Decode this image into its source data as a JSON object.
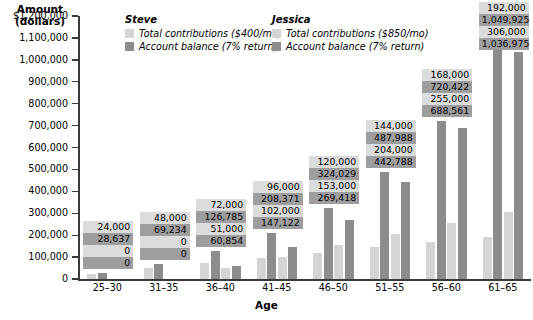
{
  "chart_data": {
    "type": "bar",
    "title": "",
    "xlabel": "Age",
    "ylabel": "Amount (dollars)",
    "ylim": [
      0,
      1200000
    ],
    "grid": false,
    "legend_position": "top",
    "categories": [
      "25–30",
      "31–35",
      "36–40",
      "41–45",
      "46–50",
      "51–55",
      "56–60",
      "61–65"
    ],
    "ytick_labels": [
      "$1,200,000",
      "1,100,000",
      "1,000,000",
      "900,000",
      "800,000",
      "700,000",
      "600,000",
      "500,000",
      "400,000",
      "300,000",
      "200,000",
      "100,000",
      "0"
    ],
    "ytick_values": [
      1200000,
      1100000,
      1000000,
      900000,
      800000,
      700000,
      600000,
      500000,
      400000,
      300000,
      200000,
      100000,
      0
    ],
    "series": [
      {
        "name": "Steve — Total contributions ($400/mo)",
        "person": "Steve",
        "kind": "contributions",
        "color": "#d5d5d5",
        "values": [
          24000,
          48000,
          72000,
          96000,
          120000,
          144000,
          168000,
          192000
        ],
        "labels": [
          "24,000",
          "48,000",
          "72,000",
          "96,000",
          "120,000",
          "144,000",
          "168,000",
          "192,000"
        ]
      },
      {
        "name": "Steve — Account balance (7% return)",
        "person": "Steve",
        "kind": "balance",
        "color": "#8c8c8c",
        "values": [
          28637,
          69234,
          126785,
          208371,
          324029,
          487988,
          720422,
          1049925
        ],
        "labels": [
          "28,637",
          "69,234",
          "126,785",
          "208,371",
          "324,029",
          "487,988",
          "720,422",
          "1,049,925"
        ]
      },
      {
        "name": "Jessica — Total contributions ($850/mo)",
        "person": "Jessica",
        "kind": "contributions",
        "color": "#d5d5d5",
        "values": [
          0,
          0,
          51000,
          102000,
          153000,
          204000,
          255000,
          306000
        ],
        "labels": [
          "0",
          "0",
          "51,000",
          "102,000",
          "153,000",
          "204,000",
          "255,000",
          "306,000"
        ]
      },
      {
        "name": "Jessica — Account balance (7% return)",
        "person": "Jessica",
        "kind": "balance",
        "color": "#8c8c8c",
        "values": [
          0,
          0,
          60854,
          147122,
          269418,
          442788,
          688561,
          1036975
        ],
        "labels": [
          "0",
          "0",
          "60,854",
          "147,122",
          "269,418",
          "442,788",
          "688,561",
          "1,036,975"
        ]
      }
    ]
  },
  "axis": {
    "y_title_line1": "Amount",
    "y_title_line2": "(dollars)",
    "x_title": "Age"
  },
  "legend": {
    "steve": {
      "title": "Steve",
      "rows": [
        {
          "label": "Total contributions ($400/mo)",
          "color": "#d5d5d5"
        },
        {
          "label": "Account balance (7% return)",
          "color": "#8c8c8c"
        }
      ]
    },
    "jessica": {
      "title": "Jessica",
      "rows": [
        {
          "label": "Total contributions ($850/mo)",
          "color": "#d5d5d5"
        },
        {
          "label": "Account balance (7% return)",
          "color": "#8c8c8c"
        }
      ]
    }
  },
  "colors": {
    "contributions": "#d5d5d5",
    "balance": "#8c8c8c",
    "label_bg_contributions": "#dcdcdc",
    "label_bg_balance": "#9e9e9e",
    "axis": "#3a3a3a",
    "background": "#ffffff"
  }
}
